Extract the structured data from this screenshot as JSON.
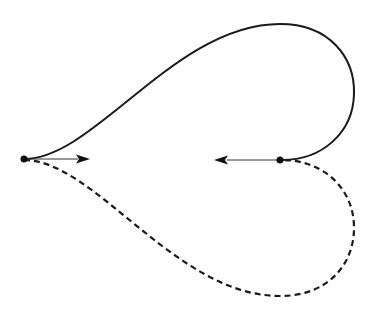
{
  "diagram": {
    "type": "closed-curve-with-tangent-vectors",
    "colors": {
      "stroke": "#1a1a1a",
      "background": "#ffffff"
    },
    "endpoints": [
      {
        "name": "start-point",
        "x": 24,
        "y": 159
      },
      {
        "name": "end-point",
        "x": 280,
        "y": 160
      }
    ],
    "curves": [
      {
        "name": "upper-curve",
        "style": "solid",
        "path": "M24,159 C95,159 175,24 280,24 C330,24 355,58 354,94 C353,133 322,160 282,160"
      },
      {
        "name": "lower-curve",
        "style": "dashed",
        "path": "M24,160 C95,160 175,296 280,296 C330,296 355,262 354,226 C353,187 322,160 282,160"
      }
    ],
    "tangent_vectors": [
      {
        "name": "start-tangent",
        "from": [
          24,
          159
        ],
        "to": [
          90,
          159
        ],
        "direction": "right"
      },
      {
        "name": "end-tangent",
        "from": [
          280,
          160
        ],
        "to": [
          215,
          160
        ],
        "direction": "left"
      }
    ]
  }
}
